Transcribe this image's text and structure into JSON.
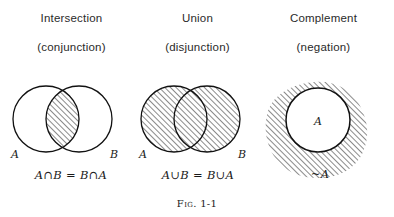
{
  "figure": {
    "caption_label": "Fig.",
    "caption_number": "1-1"
  },
  "columns": [
    {
      "id": "intersection",
      "title": "Intersection",
      "subtitle": "(conjunction)",
      "diagram": "two-overlapping-circles-lens-shaded",
      "left_set_label": "A",
      "right_set_label": "B",
      "formula": "A∩B = B∩A",
      "shaded_region": "intersection-lens"
    },
    {
      "id": "union",
      "title": "Union",
      "subtitle": "(disjunction)",
      "diagram": "two-overlapping-circles-both-shaded",
      "left_set_label": "A",
      "right_set_label": "B",
      "formula": "A∪B = B∪A",
      "shaded_region": "both-circles"
    },
    {
      "id": "complement",
      "title": "Complement",
      "subtitle": "(negation)",
      "diagram": "circle-inside-shaded-blob",
      "inner_set_label": "A",
      "formula": "~A",
      "shaded_region": "outside-circle"
    }
  ],
  "style": {
    "ink_color": "#1a1a1a",
    "background_color": "#ffffff",
    "hatch_color": "#2b2b2b"
  }
}
